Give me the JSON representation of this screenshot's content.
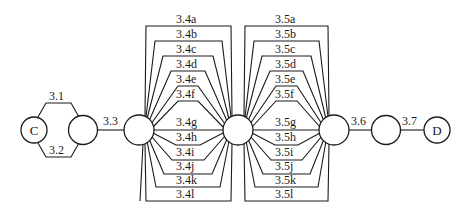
{
  "diagram": {
    "type": "reliability-network",
    "nodes": [
      {
        "id": "C",
        "label": "C"
      },
      {
        "id": "n2",
        "label": ""
      },
      {
        "id": "n3",
        "label": ""
      },
      {
        "id": "n4",
        "label": ""
      },
      {
        "id": "n5",
        "label": ""
      },
      {
        "id": "n6",
        "label": ""
      },
      {
        "id": "D",
        "label": "D"
      }
    ],
    "edges": {
      "e31": "3.1",
      "e32": "3.2",
      "e33": "3.3",
      "bundle4": [
        "3.4a",
        "3.4b",
        "3.4c",
        "3.4d",
        "3.4e",
        "3.4f",
        "3.4g",
        "3.4h",
        "3.4i",
        "3.4j",
        "3.4k",
        "3.4l"
      ],
      "bundle5": [
        "3.5a",
        "3.5b",
        "3.5c",
        "3.5d",
        "3.5e",
        "3.5f",
        "3.5g",
        "3.5h",
        "3.5i",
        "3.5j",
        "3.5k",
        "3.5l"
      ],
      "e36": "3.6",
      "e37": "3.7"
    }
  }
}
